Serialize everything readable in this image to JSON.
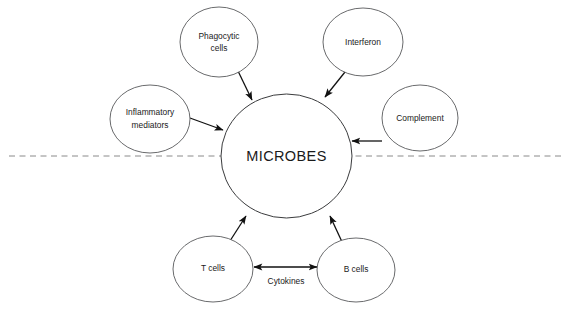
{
  "diagram": {
    "canvas": {
      "width": 569,
      "height": 311,
      "background": "#ffffff"
    },
    "colors": {
      "circle_stroke": "#58595b",
      "center_circle_stroke": "#3a3b3d",
      "arrow": "#111111",
      "divider": "#8a8a8a",
      "text": "#1a1a1a",
      "background": "#ffffff"
    },
    "center_node": {
      "id": "microbes",
      "label": "MICROBES",
      "cx": 286.5,
      "cy": 156,
      "rx": 65.5,
      "ry": 62
    },
    "nodes": [
      {
        "id": "phagocytic-cells",
        "label_line1": "Phagocytic",
        "label_line2": "cells",
        "cx": 219,
        "cy": 42,
        "rx": 39,
        "ry": 35
      },
      {
        "id": "interferon",
        "label_line1": "Interferon",
        "label_line2": "",
        "cx": 363,
        "cy": 42,
        "rx": 40,
        "ry": 34
      },
      {
        "id": "inflammatory-mediators",
        "label_line1": "Inflammatory",
        "label_line2": "mediators",
        "cx": 150,
        "cy": 119,
        "rx": 40,
        "ry": 34
      },
      {
        "id": "complement",
        "label_line1": "Complement",
        "label_line2": "",
        "cx": 420,
        "cy": 118,
        "rx": 38,
        "ry": 33
      },
      {
        "id": "t-cells",
        "label_line1": "T cells",
        "label_line2": "",
        "cx": 213,
        "cy": 269,
        "rx": 40,
        "ry": 33
      },
      {
        "id": "b-cells",
        "label_line1": "B cells",
        "label_line2": "",
        "cx": 356,
        "cy": 270,
        "rx": 39,
        "ry": 32
      }
    ],
    "arrows": [
      {
        "id": "phagocytic-to-microbes",
        "from": "phagocytic-cells",
        "to": "microbes",
        "x1": 238,
        "y1": 71,
        "x2": 252,
        "y2": 100,
        "double": false
      },
      {
        "id": "interferon-to-microbes",
        "from": "interferon",
        "to": "microbes",
        "x1": 345,
        "y1": 72,
        "x2": 325,
        "y2": 97,
        "double": false
      },
      {
        "id": "inflammatory-to-microbes",
        "from": "inflammatory-mediators",
        "to": "microbes",
        "x1": 190,
        "y1": 118,
        "x2": 223,
        "y2": 130,
        "double": false
      },
      {
        "id": "complement-to-microbes",
        "from": "complement",
        "to": "microbes",
        "x1": 382,
        "y1": 141,
        "x2": 352,
        "y2": 141,
        "double": false
      },
      {
        "id": "tcells-to-microbes",
        "from": "t-cells",
        "to": "microbes",
        "x1": 228,
        "y1": 244,
        "x2": 246,
        "y2": 216,
        "double": false
      },
      {
        "id": "bcells-to-microbes",
        "from": "b-cells",
        "to": "microbes",
        "x1": 343,
        "y1": 244,
        "x2": 330,
        "y2": 216,
        "double": false
      },
      {
        "id": "cytokines-tcells-bcells",
        "from": "t-cells",
        "to": "b-cells",
        "x1": 254,
        "y1": 267,
        "x2": 317,
        "y2": 267,
        "double": true
      }
    ],
    "edge_labels": [
      {
        "id": "cytokines-label",
        "text": "Cytokines",
        "x": 286,
        "y": 282
      }
    ],
    "divider": {
      "id": "innate-adaptive-divider",
      "label": "",
      "x1": 9,
      "x2": 561,
      "y": 156,
      "style": "dashed"
    }
  }
}
